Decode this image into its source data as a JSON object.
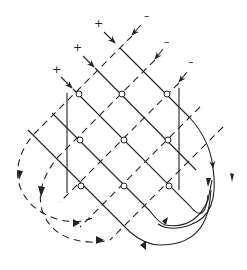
{
  "diagram": {
    "plus_labels": [
      {
        "text": "+",
        "x": 94,
        "y": 18
      },
      {
        "text": "+",
        "x": 73,
        "y": 42
      },
      {
        "text": "+",
        "x": 52,
        "y": 64
      }
    ],
    "minus_labels": [
      {
        "text": "–",
        "x": 144,
        "y": 10
      },
      {
        "text": "–",
        "x": 164,
        "y": 36
      },
      {
        "text": "–",
        "x": 188,
        "y": 56
      }
    ],
    "nodes": [
      [
        79,
        94
      ],
      [
        122,
        94
      ],
      [
        167,
        94
      ],
      [
        80,
        140
      ],
      [
        124,
        140
      ],
      [
        168,
        140
      ],
      [
        81,
        186
      ],
      [
        124,
        186
      ],
      [
        169,
        186
      ]
    ],
    "colors": {
      "line": "#222222",
      "background": "#ffffff"
    }
  }
}
